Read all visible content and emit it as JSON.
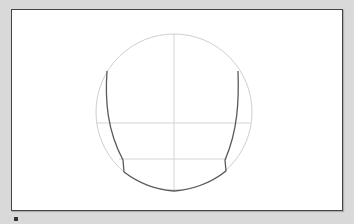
{
  "diagram": {
    "title": "",
    "colors": {
      "background": "#d9d9d9",
      "canvas": "#ffffff",
      "frame": "#444444",
      "guides": "#c8c8c8",
      "outline": "#555555"
    },
    "circle": {
      "cx": 174,
      "cy": 112,
      "r": 78
    },
    "guides": {
      "vertical_x": 174,
      "horizontal_y": [
        123,
        159
      ]
    }
  }
}
